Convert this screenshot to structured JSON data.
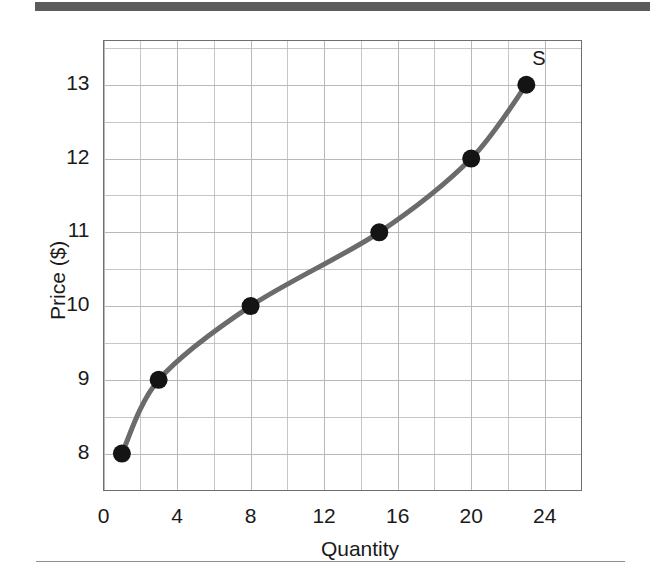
{
  "figure": {
    "background_color": "#ffffff",
    "top_bar_color": "#5b5b5b",
    "bottom_rule_color": "#8f8f8f"
  },
  "chart_data": {
    "type": "line",
    "title": "",
    "subtitle": "",
    "xlabel": "Quantity",
    "ylabel": "Price ($)",
    "xlim": [
      0,
      26
    ],
    "ylim": [
      7.5,
      13.6
    ],
    "xticks": [
      0,
      4,
      8,
      12,
      16,
      20,
      24
    ],
    "xtick_labels": [
      "0",
      "4",
      "8",
      "12",
      "16",
      "20",
      "24"
    ],
    "yticks": [
      8,
      9,
      10,
      11,
      12,
      13
    ],
    "ytick_labels": [
      "8",
      "9",
      "10",
      "11",
      "12",
      "13"
    ],
    "grid": true,
    "grid_color": "#b8b8b8",
    "minor_grid_x_step": 2,
    "minor_grid_y_step": 0.5,
    "legend": "none",
    "series": [
      {
        "name": "S",
        "annotation": "S",
        "line_color": "#6b6b6b",
        "marker_color": "#141414",
        "x": [
          1,
          3,
          8,
          15,
          20,
          23
        ],
        "y": [
          8,
          9,
          10,
          11,
          12,
          13
        ],
        "points": [
          {
            "x": 1,
            "y": 8
          },
          {
            "x": 3,
            "y": 9
          },
          {
            "x": 8,
            "y": 10
          },
          {
            "x": 15,
            "y": 11
          },
          {
            "x": 20,
            "y": 12
          },
          {
            "x": 23,
            "y": 13
          }
        ]
      }
    ]
  }
}
